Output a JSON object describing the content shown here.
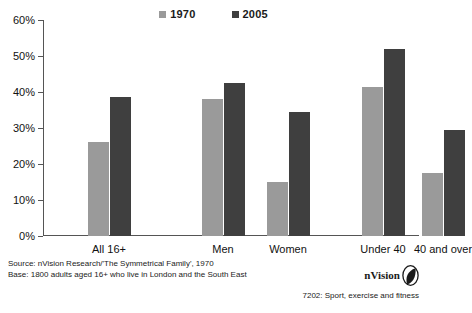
{
  "chart_data": {
    "type": "bar",
    "title": "",
    "xlabel": "",
    "ylabel": "",
    "ylim": [
      0,
      60
    ],
    "ytick_values": [
      0,
      10,
      20,
      30,
      40,
      50,
      60
    ],
    "ytick_labels": [
      "0%",
      "10%",
      "20%",
      "30%",
      "40%",
      "50%",
      "60%"
    ],
    "grid": false,
    "legend_position": "top-center",
    "categories": [
      "All 16+",
      "Men",
      "Women",
      "Under 40",
      "40 and over"
    ],
    "series": [
      {
        "name": "1970",
        "color": "#9a9a9a",
        "values": [
          26,
          38,
          15,
          41.5,
          17.5
        ]
      },
      {
        "name": "2005",
        "color": "#3f3f3f",
        "values": [
          38.5,
          42.5,
          34.5,
          52,
          29.5
        ]
      }
    ]
  },
  "legend": {
    "items": [
      {
        "label": "1970",
        "color": "#9a9a9a"
      },
      {
        "label": "2005",
        "color": "#3f3f3f"
      }
    ]
  },
  "footer": {
    "source_line_1": "Source: nVision Research/'The Symmetrical Family', 1970",
    "source_line_2": "Base: 1800 adults aged 16+ who live in London and the South East",
    "brand_name": "nVision",
    "code_line": "7202: Sport, exercise and fitness"
  }
}
